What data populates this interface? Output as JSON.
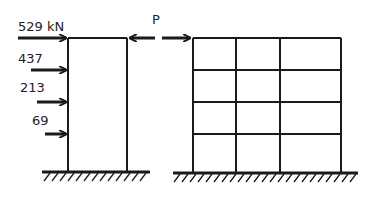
{
  "diagram": {
    "left_frame": {
      "description": "single-bay frame with lateral story loads",
      "loads": [
        {
          "label": "529 kN",
          "y": 38
        },
        {
          "label": "437",
          "y": 70
        },
        {
          "label": "213",
          "y": 102
        },
        {
          "label": "69",
          "y": 134
        }
      ]
    },
    "link_force": {
      "label": "P"
    },
    "right_frame": {
      "description": "three-bay, four-story frame",
      "bays": 3,
      "stories": 4
    },
    "colors": {
      "line": "#1a1a1a",
      "background": "#ffffff"
    }
  }
}
